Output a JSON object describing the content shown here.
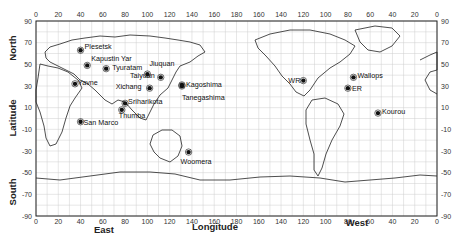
{
  "map": {
    "title": "World map of launch sites",
    "axes": {
      "top_ticks": [
        "0",
        "20",
        "40",
        "60",
        "80",
        "100",
        "120",
        "140",
        "160",
        "180",
        "160",
        "140",
        "120",
        "100",
        "80",
        "60",
        "40",
        "20",
        "0"
      ],
      "bottom_ticks": [
        "0",
        "20",
        "40",
        "60",
        "80",
        "100",
        "120",
        "140",
        "160",
        "180",
        "160",
        "140",
        "120",
        "100",
        "80",
        "60",
        "40",
        "20",
        "0"
      ],
      "left_ticks": [
        "90",
        "70",
        "50",
        "30",
        "10",
        "-10",
        "-30",
        "-50",
        "-70",
        "-90"
      ],
      "right_ticks": [
        "90",
        "70",
        "50",
        "30",
        "10",
        "-10",
        "-30",
        "-50",
        "-70",
        "-90"
      ],
      "x_label": "Longitude",
      "x_label_east": "East",
      "x_label_west": "West",
      "y_label": "Latitude",
      "y_label_north": "North",
      "y_label_south": "South"
    },
    "sites": [
      {
        "name": "Plesetsk",
        "lon": 40,
        "lat": 63
      },
      {
        "name": "Kapustin Yar",
        "lon": 46,
        "lat": 49
      },
      {
        "name": "Tyuratam",
        "lon": 63,
        "lat": 46
      },
      {
        "name": "Jiuquan",
        "lon": 100,
        "lat": 41
      },
      {
        "name": "Taiyuan",
        "lon": 112,
        "lat": 38
      },
      {
        "name": "Xichang",
        "lon": 102,
        "lat": 28
      },
      {
        "name": "Yavne",
        "lon": 35,
        "lat": 32
      },
      {
        "name": "Sriharikota",
        "lon": 80,
        "lat": 14
      },
      {
        "name": "Thumba",
        "lon": 77,
        "lat": 8
      },
      {
        "name": "San Marco",
        "lon": 40,
        "lat": -3
      },
      {
        "name": "Kagoshima",
        "lon": 131,
        "lat": 31
      },
      {
        "name": "Tanegashima",
        "lon": 131,
        "lat": 30
      },
      {
        "name": "Woomera",
        "lon": 137,
        "lat": -31
      },
      {
        "name": "WR",
        "lon": -120,
        "lat": 35
      },
      {
        "name": "Wallops",
        "lon": -75,
        "lat": 38
      },
      {
        "name": "ER",
        "lon": -80,
        "lat": 28
      },
      {
        "name": "Kourou",
        "lon": -53,
        "lat": 5
      }
    ]
  }
}
